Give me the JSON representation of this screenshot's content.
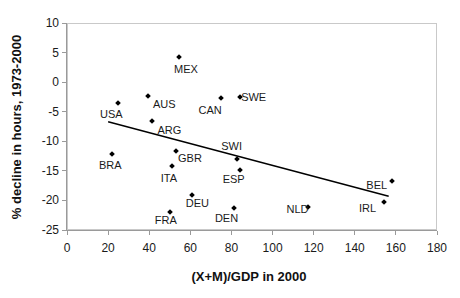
{
  "chart_data": {
    "type": "scatter",
    "title": "",
    "xlabel": "(X+M)/GDP in 2000",
    "ylabel": "% decline in hours, 1973-2000",
    "xlim": [
      0,
      180
    ],
    "ylim": [
      -25,
      10
    ],
    "x_ticks": [
      0,
      20,
      40,
      60,
      80,
      100,
      120,
      140,
      160,
      180
    ],
    "y_ticks": [
      10,
      5,
      0,
      -5,
      -10,
      -15,
      -20,
      -25
    ],
    "grid": false,
    "legend": false,
    "colors": {
      "marker": "#000000",
      "trendline": "#000000",
      "axis": "#9a9a9a",
      "frame": "#c9c9c9",
      "text": "#1a1a1a"
    },
    "points": [
      {
        "label": "MEX",
        "x": 54.5,
        "y": 4.3,
        "label_offset": [
          7,
          12
        ]
      },
      {
        "label": "USA",
        "x": 25,
        "y": -3.5,
        "label_offset": [
          -7,
          11
        ]
      },
      {
        "label": "AUS",
        "x": 39.5,
        "y": -2.3,
        "label_offset": [
          16,
          8
        ]
      },
      {
        "label": "CAN",
        "x": 75,
        "y": -2.6,
        "label_offset": [
          -11,
          12
        ]
      },
      {
        "label": "SWE",
        "x": 84,
        "y": -2.5,
        "label_offset": [
          14,
          0
        ]
      },
      {
        "label": "ARG",
        "x": 41.5,
        "y": -6.5,
        "label_offset": [
          17,
          9
        ]
      },
      {
        "label": "BRA",
        "x": 22,
        "y": -12.2,
        "label_offset": [
          -2,
          11
        ]
      },
      {
        "label": "GBR",
        "x": 53,
        "y": -11.6,
        "label_offset": [
          14,
          7
        ]
      },
      {
        "label": "SWI",
        "x": 82.5,
        "y": -13.0,
        "label_offset": [
          -5,
          -13
        ]
      },
      {
        "label": "ITA",
        "x": 51,
        "y": -14.2,
        "label_offset": [
          -3,
          12
        ]
      },
      {
        "label": "ESP",
        "x": 84,
        "y": -14.9,
        "label_offset": [
          -6,
          9
        ]
      },
      {
        "label": "BEL",
        "x": 158,
        "y": -16.7,
        "label_offset": [
          -15,
          4
        ]
      },
      {
        "label": "DEU",
        "x": 61,
        "y": -19.1,
        "label_offset": [
          5,
          8
        ]
      },
      {
        "label": "IRL",
        "x": 154,
        "y": -20.3,
        "label_offset": [
          -16,
          6
        ]
      },
      {
        "label": "NLD",
        "x": 117,
        "y": -21.1,
        "label_offset": [
          -10,
          2
        ]
      },
      {
        "label": "FRA",
        "x": 50,
        "y": -22.0,
        "label_offset": [
          -4,
          8
        ]
      },
      {
        "label": "DEN",
        "x": 81,
        "y": -21.3,
        "label_offset": [
          -7,
          10
        ]
      }
    ],
    "trendline": {
      "x1": 20,
      "y1": -6.7,
      "x2": 156.5,
      "y2": -19.3
    }
  }
}
